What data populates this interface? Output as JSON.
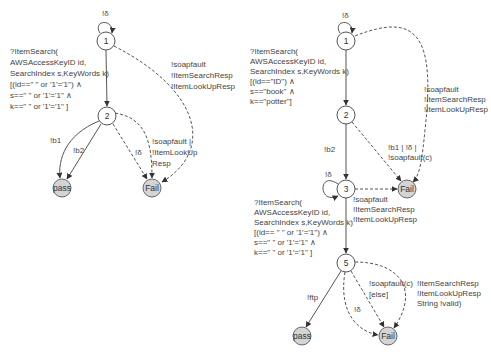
{
  "left_diagram": {
    "nodes": {
      "s1": "1",
      "s2": "2",
      "pass": "pass",
      "fail": "Fail"
    },
    "edges": {
      "s1_loop": "!δ",
      "s1_to_s2": [
        "?ItemSearch(",
        "AWSAccessKeyID id,",
        "SearchIndex s,KeyWords k)",
        "[(id==\" \" or '1'='1\") ∧",
        "s==\" \" or '1'='1\" ∧",
        "k==\" \" or '1'='1\" ]"
      ],
      "s1_to_fail": [
        "!soapfault",
        "!ItemSearchResp",
        "!ItemLookUpResp"
      ],
      "s2_to_pass_b1": "!b1",
      "s2_to_pass_b2": "!b2",
      "s2_to_fail_delta": "!δ",
      "s2_to_fail_fault": [
        "!soapfault |",
        "!ItemLookUp",
        "Resp"
      ]
    }
  },
  "right_diagram": {
    "nodes": {
      "s1": "1",
      "s2": "2",
      "s3": "3",
      "s5": "5",
      "pass": "pass",
      "fail_top": "Fail",
      "fail_bottom": "Fail"
    },
    "edges": {
      "s1_loop": "!δ",
      "s1_to_s2": [
        "?ItemSearch(",
        "AWSAccessKeyID id,",
        "SearchIndex s,KeyWords k)",
        "[(id==\"ID\") ∧",
        "s==\"book\" ∧",
        "k==\"potter\"]"
      ],
      "s1_to_fail": [
        "!soapfault",
        "!ItemSearchResp",
        "!ItemLookUpResp"
      ],
      "s2_to_s3": "!b2",
      "s2_to_fail": [
        "!b1 | !δ |",
        "!soapfault(c)"
      ],
      "s3_loop": "!δ",
      "s3_to_fail": [
        "!soapfault",
        "!ItemSearchResp",
        "!ItemLookUpResp"
      ],
      "s3_to_s5": [
        "?ItemSearch(",
        "AWSAccessKeyID id,",
        "SearchIndex s,KeyWords k)",
        "[(id== \" \" or '1'='1\") ∧",
        "s==\" \" or '1'='1\" ∧",
        "k==\" \" or '1'='1\" ]"
      ],
      "s5_to_pass": "!ftp",
      "s5_to_fail_delta": "!δ",
      "s5_to_fail_fault": [
        "!soapfault(c)",
        "[else]"
      ],
      "s5_to_fail_resp": [
        "!ItemSearchResp",
        "!ItemLookUpResp",
        "String !valid)"
      ]
    }
  },
  "colors": {
    "stroke": "#555555",
    "final_fill": "#d4d4d4",
    "text": "#444444"
  }
}
